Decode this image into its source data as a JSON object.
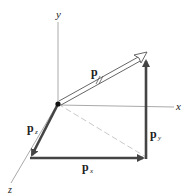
{
  "diagram": {
    "type": "vector-decomposition-3d",
    "axes": {
      "x_label": "x",
      "y_label": "y",
      "z_label": "z"
    },
    "vectors": {
      "p": {
        "label": "p",
        "style": "double-line-open-arrow"
      },
      "p_x": {
        "label": "p",
        "subscript": "x"
      },
      "p_y": {
        "label": "p",
        "subscript": "y"
      },
      "p_z": {
        "label": "p",
        "subscript": "z"
      }
    },
    "colors": {
      "axis": "#aaaaaa",
      "component": "#444444",
      "dashed": "#bbbbbb",
      "origin": "#111111"
    }
  }
}
